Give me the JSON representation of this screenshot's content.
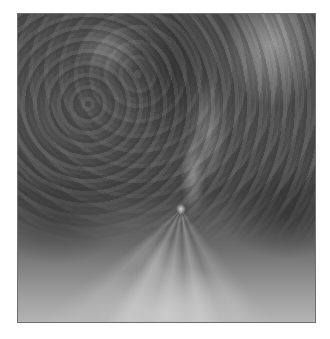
{
  "image": {
    "description": "Grayscale abstract fractal-like texture with rays converging at a bright focal point below center",
    "palette": {
      "dark": "#474747",
      "mid": "#5a5a5a",
      "light": "#b4b4b4",
      "border": "#6e6e6e",
      "background": "#ffffff"
    },
    "frame": {
      "x": 17,
      "y": 13,
      "width": 299,
      "height": 310
    },
    "focal_point": {
      "x": 180,
      "y": 208
    }
  },
  "caption": ""
}
